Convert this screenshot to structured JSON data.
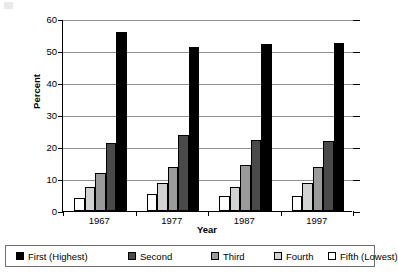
{
  "chart_data": {
    "type": "bar",
    "title": "",
    "xlabel": "Year",
    "ylabel": "Percent",
    "categories": [
      "1967",
      "1977",
      "1987",
      "1997"
    ],
    "ylim": [
      0,
      60
    ],
    "yticks": [
      0,
      10,
      20,
      30,
      40,
      50,
      60
    ],
    "ytick_labels": [
      "0",
      "10",
      "20",
      "30",
      "40",
      "50",
      "60"
    ],
    "grid": true,
    "legend_position": "bottom",
    "series": [
      {
        "name": "First (Highest)",
        "color": "#000000",
        "values": [
          55.8,
          51.2,
          52.3,
          52.4
        ]
      },
      {
        "name": "Second",
        "color": "#4a4a4a",
        "values": [
          21.2,
          23.7,
          22.2,
          21.8
        ]
      },
      {
        "name": "Third",
        "color": "#9a9a9a",
        "values": [
          11.8,
          13.8,
          14.3,
          13.8
        ]
      },
      {
        "name": "Fourth",
        "color": "#d2d2d2",
        "values": [
          7.4,
          8.8,
          7.5,
          8.9
        ]
      },
      {
        "name": "Fifth (Lowest)",
        "color": "#ffffff",
        "values": [
          4.0,
          5.3,
          4.8,
          4.8
        ]
      }
    ],
    "bar_draw_order": [
      "Fifth (Lowest)",
      "Fourth",
      "Third",
      "Second",
      "First (Highest)"
    ]
  },
  "legend": {
    "items": [
      {
        "label": "First (Highest)",
        "color": "#000000"
      },
      {
        "label": "Second",
        "color": "#4a4a4a"
      },
      {
        "label": "Third",
        "color": "#9a9a9a"
      },
      {
        "label": "Fourth",
        "color": "#d2d2d2"
      },
      {
        "label": "Fifth (Lowest)",
        "color": "#ffffff"
      }
    ]
  },
  "axes": {
    "y_title": "Percent",
    "x_title": "Year"
  }
}
